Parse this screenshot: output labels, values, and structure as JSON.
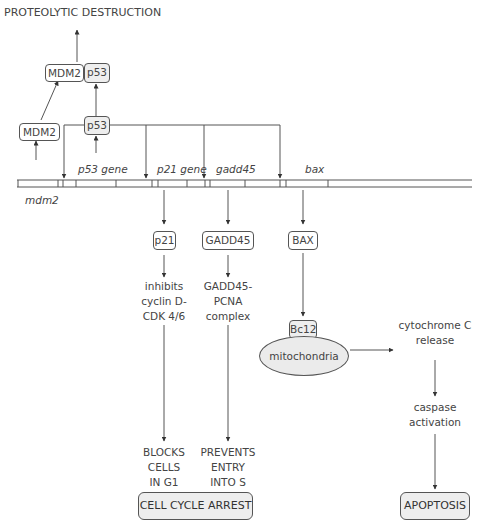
{
  "title": "PROTEOLYTIC DESTRUCTION",
  "proteins": {
    "mdm2_top": "MDM2",
    "p53_top": "p53",
    "mdm2_low": "MDM2",
    "p53_low": "p53",
    "p21": "p21",
    "gadd45": "GADD45",
    "bax": "BAX",
    "bcl2": "Bc12"
  },
  "genes": {
    "p53": "p53 gene",
    "p21": "p21 gene",
    "gadd45": "gadd45",
    "bax": "bax",
    "mdm2": "mdm2"
  },
  "effects": {
    "p21_effect": [
      "inhibits",
      "cyclin D-",
      "CDK 4/6"
    ],
    "gadd45_effect": [
      "GADD45-",
      "PCNA",
      "complex"
    ],
    "p21_outcome": [
      "BLOCKS",
      "CELLS",
      "IN G1"
    ],
    "gadd45_outcome": [
      "PREVENTS",
      "ENTRY",
      "INTO S"
    ],
    "cytochrome": [
      "cytochrome C",
      "release"
    ],
    "caspase": [
      "caspase",
      "activation"
    ]
  },
  "organelle": "mitochondria",
  "outcomes": {
    "arrest": "CELL CYCLE ARREST",
    "apoptosis": "APOPTOSIS"
  },
  "colors": {
    "line": "#444444",
    "shaded_fill": "#eeeeee",
    "text": "#444444"
  }
}
